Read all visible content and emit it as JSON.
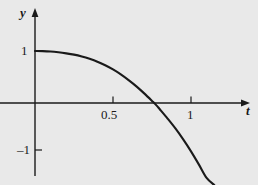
{
  "figure": {
    "background_color": "#e9e9e9",
    "ink_color": "#1a1a1a",
    "width": 258,
    "height": 185
  },
  "axes": {
    "x_axis_name": "t",
    "y_axis_name": "y",
    "origin_px": [
      35,
      103
    ],
    "x_unit_px": 156,
    "y_unit_px": 52,
    "x_ticks": [
      {
        "value": 0.5,
        "label": "0.5",
        "px": 113
      },
      {
        "value": 1.0,
        "label": "1",
        "px": 191
      }
    ],
    "y_ticks": [
      {
        "value": 1,
        "label": "1",
        "px": 51
      },
      {
        "value": -1,
        "label": "–1",
        "px": 150
      }
    ],
    "x_arrow": true,
    "y_arrow": true
  },
  "chart_data": {
    "type": "line",
    "title": "",
    "subtitle": "",
    "xlabel": "t",
    "ylabel": "y",
    "xlim": [
      -0.05,
      1.35
    ],
    "ylim": [
      -1.55,
      1.3
    ],
    "grid": false,
    "legend": null,
    "annotations": [],
    "series": [
      {
        "name": "solution curve",
        "description": "Curve starting at (0, 1) with zero initial slope, decreasing ever more steeply, crossing the t-axis near t = 0.78 and plunging off the bottom of the frame near t = 1.15.",
        "x": [
          0.0,
          0.05,
          0.1,
          0.15,
          0.2,
          0.25,
          0.3,
          0.35,
          0.4,
          0.45,
          0.5,
          0.55,
          0.6,
          0.65,
          0.7,
          0.75,
          0.78,
          0.8,
          0.85,
          0.9,
          0.95,
          1.0,
          1.05,
          1.1,
          1.15
        ],
        "y": [
          1.0,
          0.998,
          0.99,
          0.975,
          0.955,
          0.93,
          0.895,
          0.85,
          0.795,
          0.725,
          0.645,
          0.55,
          0.44,
          0.32,
          0.185,
          0.04,
          -0.05,
          -0.12,
          -0.3,
          -0.49,
          -0.7,
          -0.93,
          -1.18,
          -1.44,
          -1.58
        ]
      }
    ]
  },
  "caption": {
    "text": ""
  }
}
